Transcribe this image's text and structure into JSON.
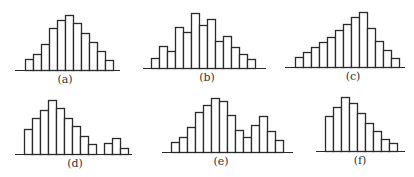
{
  "chart_data": [
    {
      "type": "bar",
      "id": "a",
      "title": "(a)",
      "description": "symmetric unimodal",
      "values": [
        11,
        16,
        26,
        42,
        50,
        55,
        47,
        37,
        28,
        19,
        10
      ],
      "layout": {
        "x0": 25,
        "barw": 8,
        "baseline": 70,
        "axis_x1": 15,
        "axis_x2": 120,
        "label_x": 45,
        "label_y": 73
      }
    },
    {
      "type": "bar",
      "id": "b",
      "title": "(b)",
      "description": "jagged roughly symmetric",
      "values": [
        10,
        22,
        17,
        41,
        36,
        55,
        43,
        49,
        27,
        32,
        21,
        14,
        9
      ],
      "layout": {
        "x0": 151,
        "barw": 8,
        "baseline": 68,
        "axis_x1": 143,
        "axis_x2": 266,
        "label_x": 187,
        "label_y": 71
      }
    },
    {
      "type": "bar",
      "id": "c",
      "title": "(c)",
      "description": "left-skewed",
      "values": [
        10,
        15,
        20,
        25,
        30,
        37,
        43,
        50,
        55,
        39,
        26,
        17,
        9
      ],
      "layout": {
        "x0": 295,
        "barw": 8,
        "baseline": 67,
        "axis_x1": 285,
        "axis_x2": 405,
        "label_x": 333,
        "label_y": 70
      }
    },
    {
      "type": "bar",
      "id": "d",
      "title": "(d)",
      "description": "right-skewed with gap and small second group",
      "values": [
        25,
        36,
        44,
        54,
        46,
        36,
        28,
        18,
        10,
        0,
        11,
        16,
        6
      ],
      "layout": {
        "x0": 24,
        "barw": 8,
        "baseline": 154,
        "axis_x1": 15,
        "axis_x2": 132,
        "label_x": 55,
        "label_y": 157
      }
    },
    {
      "type": "bar",
      "id": "e",
      "title": "(e)",
      "description": "bimodal",
      "values": [
        10,
        15,
        25,
        40,
        47,
        54,
        51,
        37,
        22,
        15,
        27,
        36,
        21,
        12
      ],
      "layout": {
        "x0": 171,
        "barw": 8,
        "baseline": 152,
        "axis_x1": 162,
        "axis_x2": 293,
        "label_x": 201,
        "label_y": 155
      }
    },
    {
      "type": "bar",
      "id": "f",
      "title": "(f)",
      "description": "right-skewed",
      "values": [
        35,
        44,
        54,
        48,
        38,
        28,
        20,
        12,
        8
      ],
      "layout": {
        "x0": 325,
        "barw": 8,
        "baseline": 151,
        "axis_x1": 316,
        "axis_x2": 405,
        "label_x": 340,
        "label_y": 154
      }
    }
  ],
  "colors": {
    "stroke": "#2a2a2a",
    "fill": "#ffffff"
  }
}
